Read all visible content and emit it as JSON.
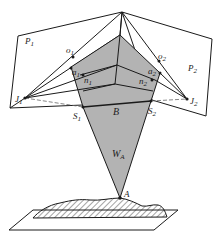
{
  "figure": {
    "type": "stereo-vision geometry diagram",
    "colors": {
      "line": "#1a1a1a",
      "shade": "#b3b3b3",
      "background": "#ffffff"
    }
  },
  "labels": {
    "P1": {
      "main": "P",
      "sub": "1"
    },
    "P2": {
      "main": "P",
      "sub": "2"
    },
    "o1": {
      "main": "o",
      "sub": "1"
    },
    "o2": {
      "main": "o",
      "sub": "2"
    },
    "a1": {
      "main": "a",
      "sub": "1"
    },
    "a2": {
      "main": "a",
      "sub": "2"
    },
    "n1": {
      "main": "n",
      "sub": "1"
    },
    "n2": {
      "main": "n",
      "sub": "2"
    },
    "J1": {
      "main": "J",
      "sub": "1"
    },
    "J2": {
      "main": "J",
      "sub": "2"
    },
    "S1": {
      "main": "S",
      "sub": "1"
    },
    "S2": {
      "main": "S",
      "sub": "2"
    },
    "B": {
      "main": "B"
    },
    "WA": {
      "main": "W",
      "sub": "A"
    },
    "A": {
      "main": "A"
    }
  }
}
